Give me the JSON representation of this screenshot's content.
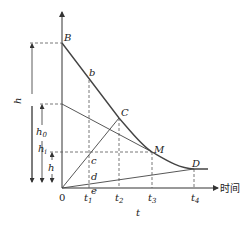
{
  "diagram": {
    "axes": {
      "x_label": "时间",
      "x_var": "t",
      "origin": "0",
      "ticks": [
        "t1",
        "t2",
        "t3",
        "t4"
      ]
    },
    "points": {
      "B": "B",
      "b": "b",
      "C": "C",
      "M": "M",
      "D": "D",
      "c": "c",
      "d": "d",
      "e": "e"
    },
    "heights": {
      "h_total": "h",
      "h0": "h",
      "h0_sub": "0",
      "hi": "h",
      "hi_sub": "i",
      "h_small": "h"
    },
    "tick_labels": {
      "t1": "t",
      "t1_sub": "1",
      "t2": "t",
      "t2_sub": "2",
      "t3": "t",
      "t3_sub": "3",
      "t4": "t",
      "t4_sub": "4"
    }
  }
}
